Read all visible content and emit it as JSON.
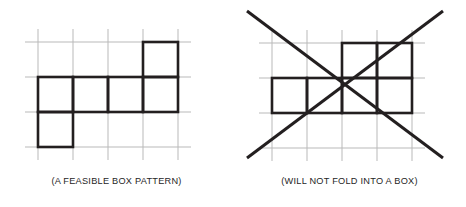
{
  "figure": {
    "background_color": "#ffffff",
    "grid_line_color": "#b9b9b9",
    "shape_line_color": "#231f20",
    "cross_line_color": "#231f20",
    "caption_color": "#262626",
    "grid_line_width": 1,
    "shape_line_width": 2.6,
    "cross_line_width": 3.0
  },
  "panels": [
    {
      "id": "feasible",
      "caption": "(A FEASIBLE BOX PATTERN)",
      "cell_size": 35,
      "origin_x": 38,
      "origin_y": 42,
      "columns": 4,
      "rows": 3,
      "filled_cells": [
        {
          "col": 3,
          "row": 0
        },
        {
          "col": 0,
          "row": 1
        },
        {
          "col": 1,
          "row": 1
        },
        {
          "col": 2,
          "row": 1
        },
        {
          "col": 3,
          "row": 1
        },
        {
          "col": 0,
          "row": 2
        }
      ],
      "crossed_out": false
    },
    {
      "id": "infeasible",
      "caption": "(WILL NOT FOLD INTO A BOX)",
      "cell_size": 35,
      "origin_x": 39,
      "origin_y": 43,
      "columns": 4,
      "rows": 3,
      "filled_cells": [
        {
          "col": 2,
          "row": 0
        },
        {
          "col": 3,
          "row": 0
        },
        {
          "col": 0,
          "row": 1
        },
        {
          "col": 1,
          "row": 1
        },
        {
          "col": 2,
          "row": 1
        },
        {
          "col": 3,
          "row": 1
        }
      ],
      "crossed_out": true,
      "cross": {
        "start_x": 14,
        "start_y": 11,
        "end_x": 210,
        "end_y": 158
      }
    }
  ]
}
